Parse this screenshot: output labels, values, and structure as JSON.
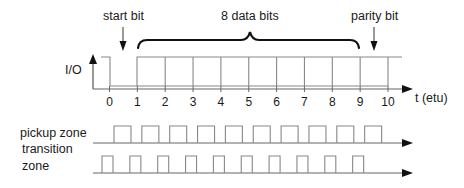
{
  "annotations": {
    "start_bit": "start bit",
    "data_bits": "8 data bits",
    "parity_bit": "parity bit"
  },
  "axis": {
    "y_label": "I/O",
    "x_label": "t (etu)",
    "ticks": [
      "0",
      "1",
      "2",
      "3",
      "4",
      "5",
      "6",
      "7",
      "8",
      "9",
      "10"
    ]
  },
  "rows": {
    "pickup": {
      "label": "pickup zone",
      "pulse_count": 10
    },
    "transition": {
      "label_line1": "transition",
      "label_line2": "zone",
      "pulse_count": 10
    }
  },
  "colors": {
    "signal": "#888888",
    "axis": "#555555",
    "brace": "#111111",
    "text": "#1a1a1a"
  }
}
